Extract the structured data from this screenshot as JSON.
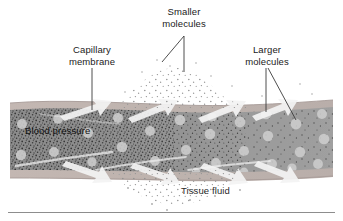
{
  "figure": {
    "width": 343,
    "height": 221,
    "background": "#ffffff"
  },
  "labels": {
    "capillary_membrane": "Capillary\nmembrane",
    "smaller_molecules": "Smaller\nmolecules",
    "larger_molecules": "Larger\nmolecules",
    "blood_pressure": "Blood pressure",
    "tissue_fluid": "Tissue fluid"
  },
  "colors": {
    "text": "#1a1a1a",
    "leader_line": "#3a3a3a",
    "vessel_lumen_left": "#8e8e8e",
    "vessel_lumen_right": "#9b9b9b",
    "membrane_band": "#bdb2ae",
    "membrane_edge": "#a79b97",
    "large_molecule": "#cfcfcf",
    "small_molecule": "#3b3b3b",
    "escaped_molecule": "#b5b5b5",
    "flow_arrow": "#f2f2f2",
    "rule": "#8d8d8d"
  },
  "anatomy": {
    "vessel_label": "capillary",
    "membrane_label": "capillary membrane",
    "lumen_label": "capillary lumen",
    "outside_label": "tissue fluid space"
  },
  "diagram_data": {
    "type": "labeled-illustration",
    "regions": [
      {
        "name": "capillary-lumen",
        "description": "interior of capillary containing blood"
      },
      {
        "name": "capillary-membrane",
        "description": "thin wall band on top and bottom of vessel"
      },
      {
        "name": "tissue-fluid",
        "description": "space outside the capillary above and below"
      }
    ],
    "particles": {
      "small_molecule_count_inside": 420,
      "small_molecule_count_outside": 260,
      "large_molecule_count": 34
    },
    "callouts": [
      {
        "label": "Capillary\nmembrane",
        "targets": 1
      },
      {
        "label": "Smaller\nmolecules",
        "targets": 2
      },
      {
        "label": "Larger\nmolecules",
        "targets": 2
      },
      {
        "label": "Blood pressure",
        "targets": 0
      },
      {
        "label": "Tissue fluid",
        "targets": 0
      }
    ]
  }
}
